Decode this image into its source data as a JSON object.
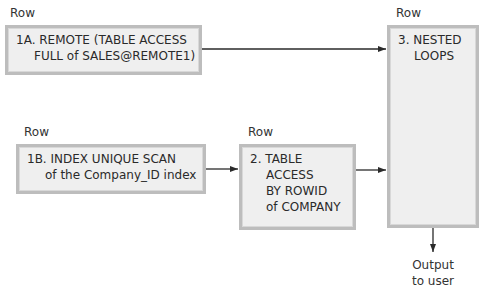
{
  "diagram": {
    "nodes": [
      {
        "id": "1A",
        "row_label": "Row",
        "lines": [
          "1A. REMOTE (TABLE ACCESS",
          "FULL of SALES@REMOTE1)"
        ]
      },
      {
        "id": "1B",
        "row_label": "Row",
        "lines": [
          "1B. INDEX UNIQUE SCAN",
          "of the Company_ID index"
        ]
      },
      {
        "id": "2",
        "row_label": "Row",
        "lines": [
          "2. TABLE",
          "ACCESS",
          "BY ROWID",
          "of COMPANY"
        ]
      },
      {
        "id": "3",
        "row_label": "Row",
        "lines": [
          "3. NESTED",
          "LOOPS"
        ]
      }
    ],
    "edges": [
      {
        "from": "1A",
        "to": "3"
      },
      {
        "from": "1B",
        "to": "2"
      },
      {
        "from": "2",
        "to": "3"
      },
      {
        "from": "3",
        "to": "output"
      }
    ],
    "output": {
      "lines": [
        "Output",
        "to user"
      ]
    }
  }
}
